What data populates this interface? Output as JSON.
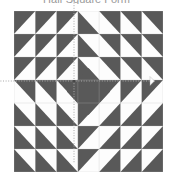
{
  "caption": {
    "text": "Half Square Form"
  },
  "colors": {
    "dark": "#595959",
    "light": "#fdfdfd",
    "background": "#ffffff",
    "grid_line": "#bdbdbd",
    "axis_line": "#a8a8a8",
    "caption_text": "#9a9a9a"
  },
  "block": {
    "name": "half-square-triangle-quilt-block",
    "rows": 7,
    "cols": 7,
    "cell_size": 21,
    "origin_x": 14,
    "origin_y": 11,
    "width": 149,
    "height": 161,
    "description": "Radiating concentric diamond quilt block built from half-square triangles",
    "legend": {
      "dark_label": "dark half",
      "light_label": "light half"
    },
    "cells": [
      [
        "tl",
        "tl",
        "tl",
        "bl",
        "tr",
        "tr",
        "tr"
      ],
      [
        "tl",
        "tl",
        "tl",
        "bl",
        "tr",
        "tr",
        "tr"
      ],
      [
        "tl",
        "tl",
        "tl",
        "bl",
        "tr",
        "tr",
        "tr"
      ],
      [
        "tr",
        "tr",
        "tr",
        "full",
        "tl",
        "tl",
        "tl"
      ],
      [
        "bl",
        "bl",
        "bl",
        "tl",
        "br",
        "br",
        "br"
      ],
      [
        "bl",
        "bl",
        "bl",
        "tl",
        "br",
        "br",
        "br"
      ],
      [
        "bl",
        "bl",
        "bl",
        "tl",
        "br",
        "br",
        "br"
      ]
    ]
  },
  "axes": {
    "horizontal": {
      "label": "horizontal-symmetry-axis",
      "y": 92,
      "x_start": 4,
      "x_end": 169,
      "style": "dotted",
      "arrow_left": true,
      "arrow_right": true
    },
    "vertical": {
      "label": "vertical-symmetry-axis",
      "x": 88,
      "y_start": 11,
      "y_end": 174,
      "style": "dotted",
      "arrow_top": false,
      "arrow_bottom": false
    },
    "center_marker": {
      "label": "center-point",
      "x": 88,
      "y": 92
    }
  }
}
